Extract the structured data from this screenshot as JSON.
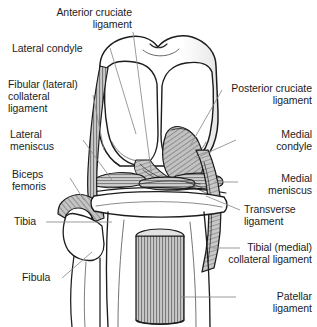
{
  "figure": {
    "background_color": "#ffffff",
    "ink_color": "#1c1c1c",
    "leader_color": "#7a7a7a",
    "shade_color": "#b8b8b8",
    "width": 317,
    "height": 327
  },
  "labels": {
    "anterior_cruciate_ligament": "Anterior cruciate\nligament",
    "lateral_condyle": "Lateral condyle",
    "fibular_collateral_ligament": "Fibular (lateral)\ncollateral\nligament",
    "lateral_meniscus": "Lateral\nmeniscus",
    "biceps_femoris": "Biceps\nfemoris",
    "tibia": "Tibia",
    "fibula": "Fibula",
    "posterior_cruciate_ligament": "Posterior cruciate\nligament",
    "medial_condyle": "Medial\ncondyle",
    "medial_meniscus": "Medial\nmeniscus",
    "transverse_ligament": "Transverse\nligament",
    "tibial_collateral_ligament": "Tibial (medial)\ncollateral ligament",
    "patellar_ligament": "Patellar\nligament"
  },
  "structures": [
    {
      "name": "femur",
      "label": "Femur shaft and condyles"
    },
    {
      "name": "lateral-condyle",
      "label": "Lateral condyle"
    },
    {
      "name": "medial-condyle",
      "label": "Medial condyle"
    },
    {
      "name": "anterior-cruciate-ligament",
      "label": "Anterior cruciate ligament"
    },
    {
      "name": "posterior-cruciate-ligament",
      "label": "Posterior cruciate ligament"
    },
    {
      "name": "lateral-meniscus",
      "label": "Lateral meniscus"
    },
    {
      "name": "medial-meniscus",
      "label": "Medial meniscus"
    },
    {
      "name": "transverse-ligament",
      "label": "Transverse ligament"
    },
    {
      "name": "fibular-collateral-ligament",
      "label": "Fibular (lateral) collateral ligament"
    },
    {
      "name": "tibial-collateral-ligament",
      "label": "Tibial (medial) collateral ligament"
    },
    {
      "name": "biceps-femoris-tendon",
      "label": "Biceps femoris tendon"
    },
    {
      "name": "patellar-ligament",
      "label": "Patellar ligament"
    },
    {
      "name": "tibia",
      "label": "Tibia"
    },
    {
      "name": "fibula",
      "label": "Fibula"
    }
  ]
}
